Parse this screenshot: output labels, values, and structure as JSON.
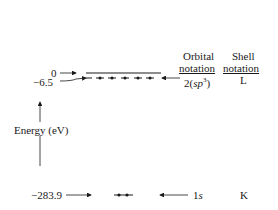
{
  "diagram": {
    "columns": {
      "orbital_header_line1": "Orbital",
      "orbital_header_line2": "notation",
      "shell_header_line1": "Shell",
      "shell_header_line2": "notation"
    },
    "axis": {
      "label": "Energy (eV)",
      "direction": "up"
    },
    "levels": [
      {
        "energy": "0",
        "orbital": "",
        "shell": "",
        "electrons": 0,
        "style": "empty line"
      },
      {
        "energy": "−6.5",
        "orbital_prefix": "2(",
        "orbital_main": "sp",
        "orbital_sup": "3",
        "orbital_suffix": ")",
        "shell": "L",
        "electrons": 4
      },
      {
        "energy": "−283.9",
        "orbital_prefix": "1",
        "orbital_main": "s",
        "shell": "K",
        "electrons": 2
      }
    ]
  }
}
